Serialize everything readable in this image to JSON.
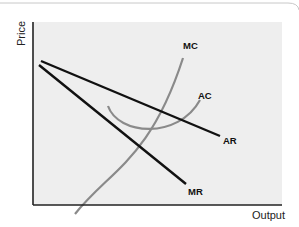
{
  "diagram": {
    "type": "economics-cost-revenue",
    "axes": {
      "y_label": "Price",
      "x_label": "Output"
    },
    "curves": [
      {
        "id": "MC",
        "label": "MC",
        "color": "#8a8a8a",
        "shape": "upward-sloping curve"
      },
      {
        "id": "AC",
        "label": "AC",
        "color": "#8a8a8a",
        "shape": "U-shaped curve"
      },
      {
        "id": "AR",
        "label": "AR",
        "color": "#111111",
        "shape": "downward-sloping line"
      },
      {
        "id": "MR",
        "label": "MR",
        "color": "#111111",
        "shape": "steeper downward-sloping line"
      }
    ],
    "plot_background": "#eeeeee",
    "axis_color": "#222222"
  }
}
